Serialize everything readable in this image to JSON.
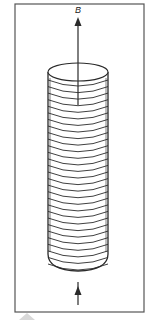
{
  "figure": {
    "type": "solenoid-magnetic-field",
    "field_label": "B",
    "coil_turns": 29,
    "frame": {
      "x": 15,
      "y": 4,
      "width": 129,
      "height": 308
    },
    "solenoid": {
      "left": 48,
      "right": 108,
      "top_y": 72,
      "bottom_y": 270
    },
    "top_arrow": {
      "x": 78,
      "y_start": 105,
      "y_end": 22,
      "direction": "up"
    },
    "bottom_arrow": {
      "x": 78,
      "y_start": 305,
      "y_end": 282,
      "direction": "up"
    },
    "colors": {
      "line": "#2a2a2a",
      "frame": "#555555",
      "background": "#ffffff",
      "watermark": "#d8d8d8"
    }
  }
}
